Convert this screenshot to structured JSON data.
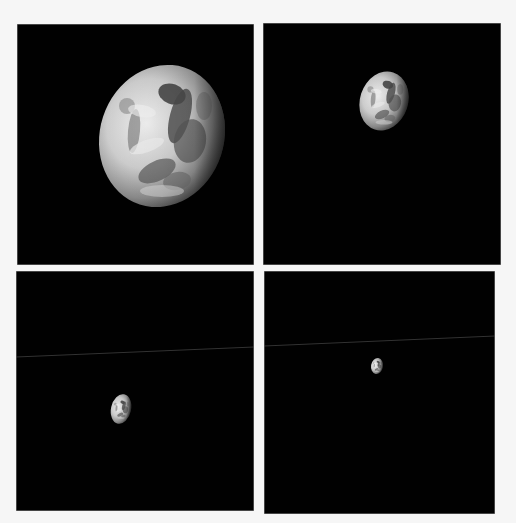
{
  "figure": {
    "background_color": "#f6f6f6",
    "panel_color": "#010101",
    "panels": [
      {
        "id": "panel-1",
        "position": "top-left",
        "box": {
          "x": 17,
          "y": 24,
          "w": 237,
          "h": 241
        },
        "earth": {
          "cx": 162,
          "cy": 136,
          "rx": 62,
          "ry": 72,
          "rotate": 18
        },
        "streak": null
      },
      {
        "id": "panel-2",
        "position": "top-right",
        "box": {
          "x": 263,
          "y": 23,
          "w": 238,
          "h": 242
        },
        "earth": {
          "cx": 384,
          "cy": 101,
          "rx": 24,
          "ry": 30,
          "rotate": 18
        },
        "streak": null
      },
      {
        "id": "panel-3",
        "position": "bottom-left",
        "box": {
          "x": 16,
          "y": 271,
          "w": 238,
          "h": 240
        },
        "earth": {
          "cx": 121,
          "cy": 409,
          "rx": 10,
          "ry": 15,
          "rotate": 12
        },
        "streak": {
          "x1": 16,
          "y1": 357,
          "x2": 254,
          "y2": 347
        }
      },
      {
        "id": "panel-4",
        "position": "bottom-right",
        "box": {
          "x": 264,
          "y": 271,
          "w": 231,
          "h": 243
        },
        "earth": {
          "cx": 377,
          "cy": 366,
          "rx": 6,
          "ry": 8,
          "rotate": 10
        },
        "streak": {
          "x1": 264,
          "y1": 346,
          "x2": 495,
          "y2": 336
        }
      }
    ]
  }
}
